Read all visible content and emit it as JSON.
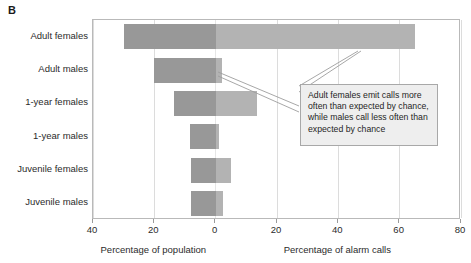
{
  "panel": {
    "label": "B"
  },
  "axes": {
    "left_title": "Percentage of population",
    "right_title": "Percentage of alarm calls",
    "ticks": [
      {
        "label": "40",
        "value": -40
      },
      {
        "label": "20",
        "value": -20
      },
      {
        "label": "0",
        "value": 0
      },
      {
        "label": "20",
        "value": 20
      },
      {
        "label": "40",
        "value": 40
      },
      {
        "label": "60",
        "value": 60
      },
      {
        "label": "80",
        "value": 80
      }
    ]
  },
  "callout": {
    "text": "Adult females emit calls more often than expected by chance, while males call less often than expected by chance"
  },
  "colors": {
    "population_bar": "#989898",
    "alarm_calls_bar": "#b3b3b3",
    "frame": "#b9b9b9",
    "gridline": "#dcdcdc",
    "callout_fill": "#eeeeee",
    "callout_border": "#a8a8a8",
    "text": "#221f1f"
  },
  "chart_data": {
    "type": "bar",
    "title": "",
    "subtitle": "",
    "orientation": "horizontal",
    "layout": "diverging population pyramid (back-to-back bars around 0)",
    "categories": [
      "Adult females",
      "Adult males",
      "1-year females",
      "1-year males",
      "Juvenile females",
      "Juvenile males"
    ],
    "series": [
      {
        "name": "Percentage of population",
        "direction": "left",
        "color": "#989898",
        "values": [
          30,
          20,
          13.5,
          8.5,
          8,
          8
        ]
      },
      {
        "name": "Percentage of alarm calls",
        "direction": "right",
        "color": "#b3b3b3",
        "values": [
          65,
          2,
          13.5,
          1,
          5,
          2.5
        ]
      }
    ],
    "xlabel_left": "Percentage of population",
    "xlabel_right": "Percentage of alarm calls",
    "ylabel": "",
    "xlim": [
      -40,
      80
    ],
    "xticks": [
      -40,
      -20,
      0,
      20,
      40,
      60,
      80
    ],
    "xticklabels": [
      "40",
      "20",
      "0",
      "20",
      "40",
      "60",
      "80"
    ],
    "grid": true,
    "legend": "none",
    "annotations": [
      {
        "text": "Adult females emit calls more often than expected by chance, while males call less often than expected by chance",
        "points_to": [
          "Adult females alarm-calls bar",
          "Adult males alarm-calls bar"
        ]
      }
    ]
  }
}
